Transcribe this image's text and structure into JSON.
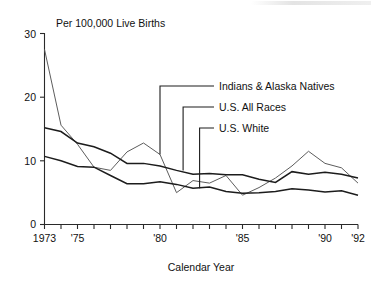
{
  "chart_data": {
    "type": "line",
    "title": "Per 100,000 Live Births",
    "xlabel": "Calendar Year",
    "ylabel": "",
    "xlim": [
      1973,
      1992
    ],
    "ylim": [
      0,
      30
    ],
    "grid": false,
    "legend_position": "inline-annotations",
    "y_ticks": [
      "0",
      "10",
      "20",
      "30"
    ],
    "y_tick_values": [
      0,
      10,
      20,
      30
    ],
    "x_tick_values": [
      1973,
      1974,
      1975,
      1976,
      1977,
      1978,
      1979,
      1980,
      1981,
      1982,
      1983,
      1984,
      1985,
      1986,
      1987,
      1988,
      1989,
      1990,
      1991,
      1992
    ],
    "x_tick_labels": [
      {
        "value": 1973,
        "label": "1973"
      },
      {
        "value": 1975,
        "label": "'75"
      },
      {
        "value": 1980,
        "label": "'80"
      },
      {
        "value": 1985,
        "label": "'85"
      },
      {
        "value": 1990,
        "label": "'90"
      },
      {
        "value": 1992,
        "label": "'92"
      }
    ],
    "x": [
      1973,
      1974,
      1975,
      1976,
      1977,
      1978,
      1979,
      1980,
      1981,
      1982,
      1983,
      1984,
      1985,
      1986,
      1987,
      1988,
      1989,
      1990,
      1991,
      1992
    ],
    "series": [
      {
        "name": "Indians & Alaska Natives",
        "color": "#5d5d5d",
        "values": [
          27.5,
          15.6,
          12.6,
          9.0,
          8.5,
          11.4,
          12.8,
          11.0,
          5.0,
          6.9,
          6.5,
          7.7,
          4.6,
          5.8,
          7.3,
          9.2,
          11.5,
          9.6,
          8.9,
          6.5
        ]
      },
      {
        "name": "U.S. All Races",
        "color": "#1c1c1c",
        "values": [
          15.2,
          14.6,
          12.8,
          12.2,
          11.2,
          9.6,
          9.6,
          9.2,
          8.5,
          7.9,
          8.0,
          7.8,
          7.8,
          7.1,
          6.6,
          8.3,
          7.9,
          8.2,
          7.9,
          7.3
        ]
      },
      {
        "name": "U.S. White",
        "color": "#1c1c1c",
        "values": [
          10.7,
          10.0,
          9.1,
          9.0,
          7.7,
          6.4,
          6.4,
          6.7,
          6.3,
          5.7,
          5.9,
          5.2,
          4.9,
          5.0,
          5.2,
          5.6,
          5.4,
          5.1,
          5.3,
          4.6
        ]
      }
    ],
    "annotations": [
      {
        "label": "Indians & Alaska Natives",
        "points_to_year": 1980,
        "points_to_value": 11.0
      },
      {
        "label": "U.S. All Races",
        "points_to_year": 1981.4,
        "points_to_value": 8.5
      },
      {
        "label": "U.S. White",
        "points_to_year": 1982.4,
        "points_to_value": 5.7
      }
    ]
  },
  "header": {
    "unit_title": "Per 100,000 Live Births"
  },
  "footer": {
    "axis_title": "Calendar Year"
  },
  "colors": {
    "axis": "#2a2a2a",
    "text": "#111111",
    "series_light": "#5d5d5d",
    "series_dark": "#1c1c1c",
    "background": "#ffffff"
  }
}
